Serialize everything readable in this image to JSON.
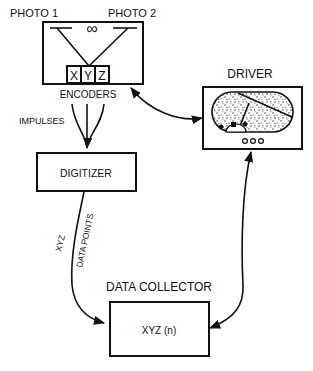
{
  "diagram": {
    "nodes": {
      "camera_unit": {
        "photo1_label": "PHOTO 1",
        "photo2_label": "PHOTO 2",
        "infinity_symbol": "∞",
        "encoder_axes": [
          "X",
          "Y",
          "Z"
        ],
        "encoders_label": "ENCODERS"
      },
      "driver": {
        "label": "DRIVER"
      },
      "digitizer": {
        "label": "DIGITIZER"
      },
      "data_collector": {
        "title": "DATA COLLECTOR",
        "label": "XYZ (n)"
      }
    },
    "edges": {
      "impulses_label": "IMPULSES",
      "xyz_label": "XYZ",
      "data_points_label": "DATA POINTS"
    }
  }
}
